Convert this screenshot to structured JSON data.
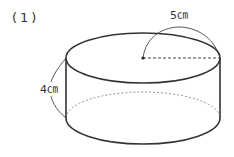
{
  "problem": {
    "number": "(1)"
  },
  "diagram": {
    "shape": "cylinder",
    "radius_label": "5㎝",
    "height_label": "4㎝",
    "colors": {
      "stroke": "#333333",
      "dashed": "#555555"
    }
  }
}
